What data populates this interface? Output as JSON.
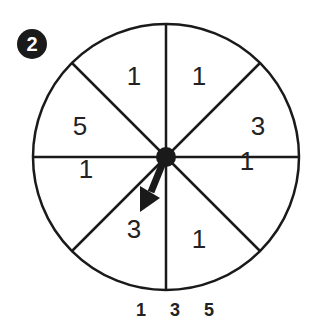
{
  "problem_number": "2",
  "spinner": {
    "sections": [
      {
        "label": "1",
        "x": 134,
        "y": 85
      },
      {
        "label": "1",
        "x": 199,
        "y": 85
      },
      {
        "label": "3",
        "x": 258,
        "y": 135
      },
      {
        "label": "1",
        "x": 247,
        "y": 170
      },
      {
        "label": "1",
        "x": 199,
        "y": 248
      },
      {
        "label": "3",
        "x": 134,
        "y": 238
      },
      {
        "label": "1",
        "x": 86,
        "y": 178
      },
      {
        "label": "5",
        "x": 80,
        "y": 135
      }
    ],
    "pointer_direction": "down-left"
  },
  "answer_choices": [
    "1",
    "3",
    "5"
  ],
  "colors": {
    "ink": "#1a1a1a"
  }
}
